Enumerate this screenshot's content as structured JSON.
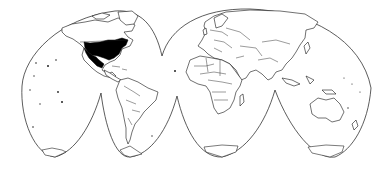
{
  "map": {
    "projection": "interrupted-homolosine",
    "background_color": "#ffffff",
    "outline_color": "#333333",
    "land_fill_color": "#ffffff",
    "border_color": "#222222",
    "highlight_color": "#000000",
    "highlighted_regions": [
      {
        "name": "United States (central-eastern)",
        "fill": "#000000"
      },
      {
        "name": "Mexico (northern)",
        "fill": "#000000"
      }
    ],
    "lobes": [
      {
        "name": "north-west",
        "region": "North America / Pacific"
      },
      {
        "name": "north-east",
        "region": "Eurasia / Africa"
      },
      {
        "name": "south-1",
        "region": "Pacific"
      },
      {
        "name": "south-2",
        "region": "South America"
      },
      {
        "name": "south-3",
        "region": "Africa / Atlantic"
      },
      {
        "name": "south-4",
        "region": "Australia / Indian Ocean"
      }
    ]
  }
}
